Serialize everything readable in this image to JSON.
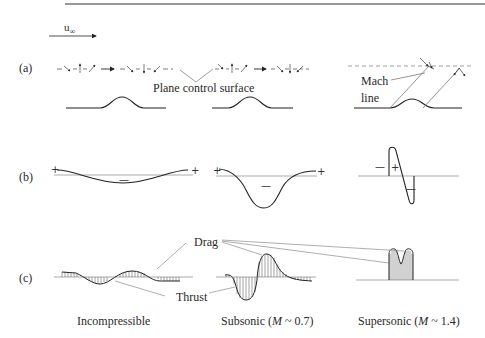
{
  "figure": {
    "freestream_label": "u",
    "freestream_subscript": "∞",
    "rows": [
      {
        "id": "a",
        "label": "(a)",
        "description": "Streamline deflection over bumps with plane control surface"
      },
      {
        "id": "b",
        "label": "(b)",
        "description": "Pressure distribution over bump"
      },
      {
        "id": "c",
        "label": "(c)",
        "description": "Drag and thrust hatching of pressure distribution"
      }
    ],
    "annotations": {
      "plane_control_surface": "Plane control surface",
      "mach_line_1": "Mach",
      "mach_line_2": "line",
      "drag": "Drag",
      "thrust": "Thrust"
    },
    "signs": {
      "plus": "+",
      "minus": "—"
    },
    "captions": [
      {
        "text": "Incompressible",
        "mach_prefix": "",
        "mach_symbol": "",
        "mach_suffix": ""
      },
      {
        "text": "Subsonic (",
        "mach_symbol": "M",
        "mach_suffix": " ~ 0.7)"
      },
      {
        "text": "Supersonic (",
        "mach_symbol": "M",
        "mach_suffix": " ~ 1.4)"
      }
    ],
    "colors": {
      "line": "#2a2a2a",
      "thin_line": "#777777",
      "top_rule": "#333333"
    }
  }
}
